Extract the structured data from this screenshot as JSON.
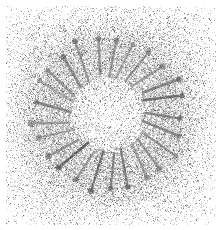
{
  "image": {
    "kind": "electron-micrograph",
    "width": 221,
    "height": 230,
    "background_color": "#ffffff",
    "caption": "",
    "title": ""
  },
  "field": {
    "noise_color_dark": "#4a4a4a",
    "noise_color_mid": "#8e8e8e",
    "noise_color_light": "#c8c8c8",
    "margin_px": 6,
    "grain_density": 0.3,
    "halo_density_boost": 0.34,
    "halo_inner_radius": 30,
    "halo_outer_radius": 96,
    "corner_falloff": 0.55,
    "seed": 20240617
  },
  "structure": {
    "name": "radial-ladder-ring",
    "center_x": 108,
    "center_y": 114,
    "ring_radius_x": 56,
    "ring_radius_y": 57,
    "spoke_count": 25,
    "spoke_inner_radius": 38,
    "spoke_outer_radius": 76,
    "spoke_color": "#7a7a7a",
    "spoke_color_dark": "#5e5e5e",
    "spoke_width": 2.1,
    "knob_radius": 2.4,
    "knob_color": "#5a5a5a",
    "rung_count": 6,
    "rung_color": "#9a9a9a",
    "rung_width": 1.0,
    "rung_half_length": 5.0,
    "rung_half_length_outer": 6.2,
    "tilt_degrees": 12,
    "jitter_amount": 2.2
  },
  "chart_data": {
    "type": "scatter",
    "title": "",
    "xlabel": "",
    "ylabel": "",
    "series": [
      {
        "name": "ladder-spokes",
        "units": "pixels",
        "note": "angle_deg = angular position around ring center; r_in/r_out = radial extent of spine",
        "fields": [
          "angle_deg",
          "r_in",
          "r_out",
          "tilt_deg",
          "rungs"
        ],
        "values": [
          [
            0,
            39,
            77,
            11,
            6
          ],
          [
            14.4,
            38,
            75,
            13,
            6
          ],
          [
            28.8,
            40,
            78,
            10,
            7
          ],
          [
            43.2,
            37,
            74,
            14,
            6
          ],
          [
            57.6,
            39,
            76,
            12,
            6
          ],
          [
            72.0,
            38,
            77,
            11,
            7
          ],
          [
            86.4,
            40,
            75,
            13,
            6
          ],
          [
            100.8,
            37,
            76,
            12,
            6
          ],
          [
            115.2,
            39,
            78,
            10,
            7
          ],
          [
            129.6,
            38,
            74,
            14,
            6
          ],
          [
            144.0,
            40,
            77,
            12,
            6
          ],
          [
            158.4,
            37,
            75,
            11,
            6
          ],
          [
            172.8,
            39,
            76,
            13,
            7
          ],
          [
            187.2,
            38,
            78,
            10,
            6
          ],
          [
            201.6,
            40,
            74,
            12,
            6
          ],
          [
            216.0,
            37,
            77,
            14,
            7
          ],
          [
            230.4,
            39,
            75,
            11,
            6
          ],
          [
            244.8,
            38,
            76,
            13,
            6
          ],
          [
            259.2,
            40,
            78,
            10,
            7
          ],
          [
            273.6,
            37,
            74,
            12,
            6
          ],
          [
            288.0,
            39,
            77,
            14,
            6
          ],
          [
            302.4,
            38,
            75,
            11,
            6
          ],
          [
            316.8,
            40,
            76,
            13,
            7
          ],
          [
            331.2,
            37,
            78,
            10,
            6
          ],
          [
            345.6,
            39,
            75,
            12,
            6
          ]
        ]
      }
    ]
  }
}
